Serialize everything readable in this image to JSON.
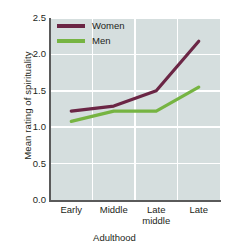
{
  "chart_data": {
    "type": "line",
    "title": "",
    "xlabel": "Adulthood",
    "ylabel": "Mean rating of spirituality",
    "categories": [
      "Early",
      "Middle",
      "Late middle",
      "Late"
    ],
    "category_lines": [
      [
        "Early"
      ],
      [
        "Middle"
      ],
      [
        "Late",
        "middle"
      ],
      [
        "Late"
      ]
    ],
    "series": [
      {
        "name": "Women",
        "color": "#6b2645",
        "values": [
          1.22,
          1.29,
          1.5,
          2.18
        ]
      },
      {
        "name": "Men",
        "color": "#76b442",
        "values": [
          1.08,
          1.22,
          1.22,
          1.55
        ]
      }
    ],
    "ylim": [
      0.0,
      2.5
    ],
    "yticks": [
      0.0,
      0.5,
      1.0,
      1.5,
      2.0,
      2.5
    ],
    "ytick_labels": [
      "0.0",
      "0.5",
      "1.0",
      "1.5",
      "2.0",
      "2.5"
    ],
    "grid": true,
    "legend_position": "upper-left-inside",
    "plot_background": "#d5dede",
    "gridline_color": "#ffffff",
    "axis_color": "#5a5a5a",
    "text_color": "#231f20"
  }
}
